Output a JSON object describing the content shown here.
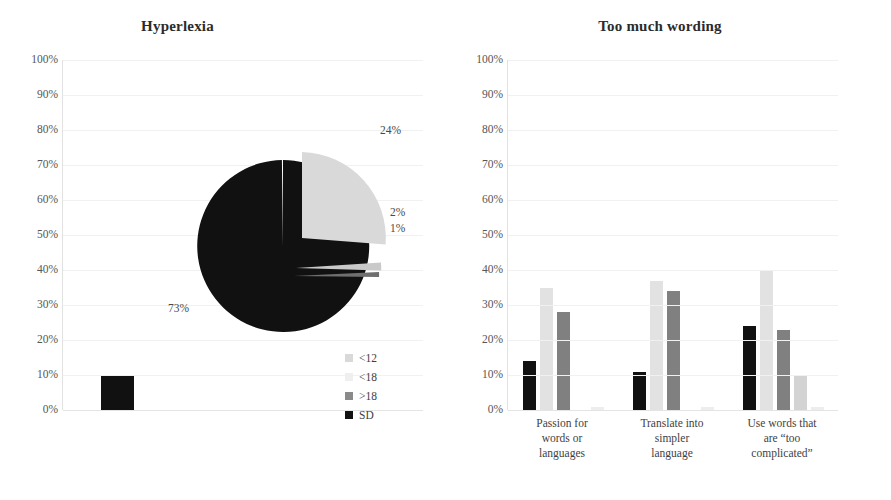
{
  "chart_data": [
    {
      "type": "pie",
      "title": "Hyperlexia",
      "panel": "left",
      "labels": [
        "<12",
        "<18",
        ">18",
        "SD"
      ],
      "values": [
        24,
        2,
        1,
        73
      ],
      "value_labels": [
        "24%",
        "2%",
        "1%",
        "73%"
      ],
      "colors": [
        "#d9d9d9",
        "#bfbfbf",
        "#7f7f7f",
        "#111111"
      ],
      "legend_position": "bottom-right",
      "axis": {
        "ticks": [
          "100%",
          "90%",
          "80%",
          "70%",
          "60%",
          "50%",
          "40%",
          "30%",
          "20%",
          "10%",
          "0%"
        ],
        "ylim": [
          0,
          100
        ],
        "grid": true
      },
      "overlay_bar": {
        "series": "SD",
        "value": 10,
        "color": "#111111"
      }
    },
    {
      "type": "bar",
      "title": "Too much wording",
      "panel": "right",
      "categories": [
        "Passion for words or languages",
        "Translate into simpler language",
        "Use words that are “too complicated”"
      ],
      "category_lines": [
        [
          "Passion for",
          "words or",
          "languages"
        ],
        [
          "Translate into",
          "simpler",
          "language"
        ],
        [
          "Use words that",
          "are “too",
          "complicated”"
        ]
      ],
      "series": [
        {
          "name": "Never",
          "color": "#111111",
          "values": [
            14,
            11,
            24
          ]
        },
        {
          "name": "Sometimes",
          "color": "#e2e2e2",
          "values": [
            35,
            37,
            40
          ]
        },
        {
          "name": "Often",
          "color": "#808080",
          "values": [
            28,
            34,
            23
          ]
        },
        {
          "name": "Always",
          "color": "#d3d3d3",
          "values": [
            0,
            0,
            10
          ]
        },
        {
          "name": "Not sure",
          "color": "#ededed",
          "values": [
            1,
            1,
            1
          ]
        }
      ],
      "xlabel": "",
      "ylabel": "",
      "ylim": [
        0,
        100
      ],
      "grid": true,
      "legend_position": "right",
      "axis": {
        "ticks": [
          "100%",
          "90%",
          "80%",
          "70%",
          "60%",
          "50%",
          "40%",
          "30%",
          "20%",
          "10%",
          "0%"
        ]
      }
    }
  ],
  "left": {
    "title": "Hyperlexia",
    "yticks": [
      "100%",
      "90%",
      "80%",
      "70%",
      "60%",
      "50%",
      "40%",
      "30%",
      "20%",
      "10%",
      "0%"
    ],
    "pie_labels": {
      "big": "24%",
      "sliver_a": "2%",
      "sliver_b": "1%",
      "dark": "73%"
    },
    "legend": [
      {
        "label": "<12",
        "color": "#d9d9d9"
      },
      {
        "label": "<18",
        "color": "#efefef"
      },
      {
        "label": ">18",
        "color": "#8a8a8a"
      },
      {
        "label": "SD",
        "color": "#111111"
      }
    ]
  },
  "right": {
    "title": "Too much wording",
    "yticks": [
      "100%",
      "90%",
      "80%",
      "70%",
      "60%",
      "50%",
      "40%",
      "30%",
      "20%",
      "10%",
      "0%"
    ],
    "legend": [
      {
        "label": "Never",
        "color": "#111111"
      },
      {
        "label": "Sometimes",
        "color": "#e8e8e8"
      },
      {
        "label": "Often",
        "color": "#808080"
      },
      {
        "label": "Always",
        "color": "#dcdcdc"
      },
      {
        "label": "Not sure",
        "color": "#ebebeb"
      }
    ]
  }
}
